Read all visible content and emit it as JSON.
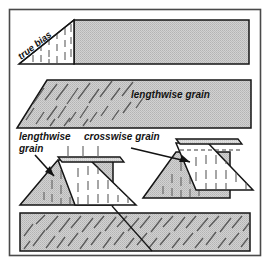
{
  "figure": {
    "name": "fabric-grain-diagram",
    "labels": {
      "true_bias": "true bias",
      "lengthwise_grain": "lengthwise grain",
      "lengthwise_grain_line1": "lengthwise",
      "lengthwise_grain_line2": "grain",
      "crosswise_grain": "crosswise grain"
    },
    "colors": {
      "fill_gray": "#c9c9c9",
      "fill_white": "#ffffff",
      "outline": "#151515",
      "background": "#ffffff",
      "frame": "#3a3a3a",
      "dash_mark": "#6f6f6f",
      "hatch_mark": "#555555"
    },
    "font_sizes": {
      "label": 10,
      "true_bias": 9
    },
    "panels": [
      {
        "id": "panel-true-bias",
        "label": "true bias",
        "description": "triangle with vertical grain dashes joined to a gray rectangle"
      },
      {
        "id": "panel-lengthwise-grain",
        "label": "lengthwise grain",
        "description": "gray parallelogram with diagonal bias hatching at left"
      },
      {
        "id": "panel-grain-trapezoids",
        "label": "lengthwise grain / crosswise grain",
        "description": "four trapezoid pieces with vertical crosswise dashes and callout arrows"
      },
      {
        "id": "panel-bias-rectangle",
        "label": "",
        "description": "gray rectangle filled with diagonal bias hatching and a seam line"
      }
    ]
  }
}
